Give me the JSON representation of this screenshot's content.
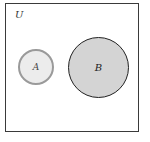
{
  "diagram": {
    "type": "venn",
    "universe_label": "U",
    "sets": [
      {
        "label": "A",
        "fill": "#ececec",
        "stroke": "#9a9a9a"
      },
      {
        "label": "B",
        "fill": "#d4d4d4",
        "stroke": "#222222"
      }
    ],
    "relationship": "disjoint"
  }
}
